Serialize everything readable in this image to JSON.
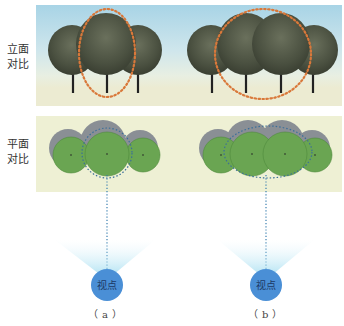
{
  "rows": {
    "elevation_label_line1": "立面",
    "elevation_label_line2": "对比",
    "plan_label_line1": "平面",
    "plan_label_line2": "对比"
  },
  "viewpoints": {
    "a_label": "视点",
    "b_label": "视点"
  },
  "subfigures": {
    "a": "（a）",
    "b": "（b）"
  },
  "caption": "",
  "colors": {
    "sky": "#a8d4e6",
    "ground": "#ecebd2",
    "tree_crown": "#4f5544",
    "focus_ring": "#d9783a",
    "plan_bg": "#eef0d4",
    "plan_tree": "#6aa552",
    "plan_shadow": "#8a8f95",
    "sightline": "#3a7fb0",
    "viewpoint": "#4a8fd6"
  },
  "diagram": {
    "a": {
      "tree_count": 3,
      "focus": "single central tree"
    },
    "b": {
      "tree_count": 4,
      "focus": "two central trees"
    }
  }
}
